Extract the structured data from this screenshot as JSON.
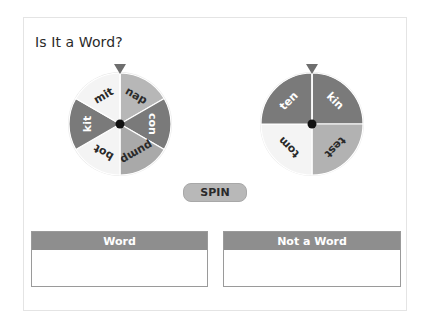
{
  "title": "Is It a Word?",
  "wheels": [
    {
      "name": "left-wheel",
      "segments": [
        {
          "label": "nap",
          "color": "#b7b7b7",
          "text_color": "#2a2a2a"
        },
        {
          "label": "con",
          "color": "#7a7a7a",
          "text_color": "#ffffff"
        },
        {
          "label": "pump",
          "color": "#a9a9a9",
          "text_color": "#2a2a2a"
        },
        {
          "label": "bot",
          "color": "#f4f4f4",
          "text_color": "#2a2a2a"
        },
        {
          "label": "kit",
          "color": "#7a7a7a",
          "text_color": "#ffffff"
        },
        {
          "label": "mit",
          "color": "#f4f4f4",
          "text_color": "#2a2a2a"
        }
      ]
    },
    {
      "name": "right-wheel",
      "segments": [
        {
          "label": "kin",
          "color": "#7a7a7a",
          "text_color": "#ffffff"
        },
        {
          "label": "test",
          "color": "#b2b2b2",
          "text_color": "#2a2a2a"
        },
        {
          "label": "tom",
          "color": "#f4f4f4",
          "text_color": "#2a2a2a"
        },
        {
          "label": "ten",
          "color": "#7a7a7a",
          "text_color": "#ffffff"
        }
      ]
    }
  ],
  "spin_button": {
    "label": "SPIN"
  },
  "bins": [
    {
      "label": "Word"
    },
    {
      "label": "Not a Word"
    }
  ],
  "colors": {
    "pointer": "#6e6e6e",
    "hub": "#111111",
    "bin_header": "#8e8e8e",
    "spin_button": "#b8b8b8"
  }
}
